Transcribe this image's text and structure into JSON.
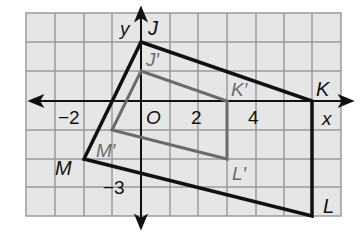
{
  "figure": {
    "type": "coordinate-plane-dilation",
    "grid": {
      "x_min": -4,
      "x_max": 7,
      "y_min": -4,
      "y_max": 3,
      "origin_px": [
        141,
        101
      ],
      "cell_px": 28.6,
      "fill_color": "#e6e6e6",
      "line_color": "#9a9a9a"
    },
    "axes": {
      "x_label": "x",
      "y_label": "y",
      "origin_label": "O",
      "tick_labels": {
        "x_neg2": "−2",
        "x_2": "2",
        "x_4": "4",
        "y_neg3": "−3"
      }
    },
    "original": {
      "name": "JKLM",
      "color": "#111111",
      "vertices": [
        {
          "label": "J",
          "x": 0,
          "y": 2
        },
        {
          "label": "K",
          "x": 6,
          "y": 0
        },
        {
          "label": "L",
          "x": 6,
          "y": -4
        },
        {
          "label": "M",
          "x": -2,
          "y": -2
        }
      ]
    },
    "image": {
      "name": "J'K'L'M'",
      "color": "#6b6b6b",
      "vertices": [
        {
          "label": "J′",
          "x": 0,
          "y": 1
        },
        {
          "label": "K′",
          "x": 3,
          "y": 0
        },
        {
          "label": "L′",
          "x": 3,
          "y": -2
        },
        {
          "label": "M′",
          "x": -1,
          "y": -1
        }
      ]
    }
  }
}
